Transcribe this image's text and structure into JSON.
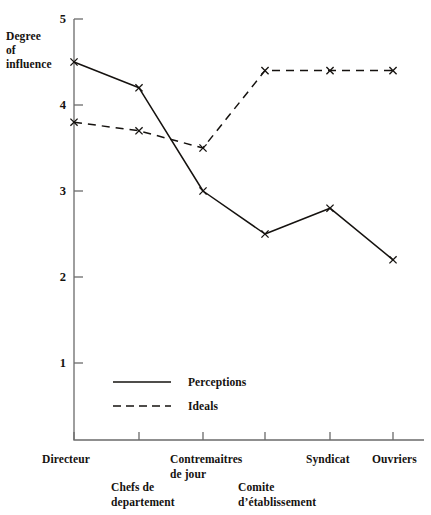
{
  "figure": {
    "y_axis_caption_lines": [
      "Degree",
      "of",
      "influence"
    ],
    "y_ticks": [
      "1",
      "2",
      "3",
      "4",
      "5"
    ]
  },
  "legend": {
    "items": [
      {
        "label": "Perceptions",
        "style": "solid",
        "color": "#15120f"
      },
      {
        "label": "Ideals",
        "style": "dashed",
        "color": "#15120f"
      }
    ]
  },
  "x_labels": [
    {
      "lines": [
        "Directeur"
      ],
      "x": 42,
      "y": 452
    },
    {
      "lines": [
        "Chefs de",
        "departement"
      ],
      "x": 111,
      "y": 480
    },
    {
      "lines": [
        "Contremaitres",
        "de jour"
      ],
      "x": 170,
      "y": 452
    },
    {
      "lines": [
        "Comite",
        "d’établissement"
      ],
      "x": 238,
      "y": 480
    },
    {
      "lines": [
        "Syndicat"
      ],
      "x": 306,
      "y": 452
    },
    {
      "lines": [
        "Ouvriers"
      ],
      "x": 372,
      "y": 452
    }
  ],
  "chart_data": {
    "type": "line",
    "title": "",
    "xlabel": "",
    "ylabel": "Degree of influence",
    "categories": [
      "Directeur",
      "Chefs de departement",
      "Contremaitres de jour",
      "Comite d’établissement",
      "Syndicat",
      "Ouvriers"
    ],
    "series": [
      {
        "name": "Perceptions",
        "style": "solid",
        "marker": "x",
        "color": "#15120f",
        "values": [
          4.5,
          4.2,
          3.0,
          2.5,
          2.8,
          2.2
        ]
      },
      {
        "name": "Ideals",
        "style": "dashed",
        "marker": "x",
        "color": "#15120f",
        "values": [
          3.8,
          3.7,
          3.5,
          4.4,
          4.4,
          4.4
        ]
      }
    ],
    "ylim": [
      0,
      5
    ],
    "yticks": [
      1,
      2,
      3,
      4,
      5
    ],
    "grid": false,
    "legend_position": "inside-lower-left"
  },
  "geometry": {
    "axis_x": 74,
    "axis_top": 19,
    "axis_bottom": 440,
    "axis_right": 424,
    "x_positions": [
      74,
      139,
      203,
      265,
      330,
      393
    ],
    "y_value_5": 19,
    "px_per_unit": 86
  }
}
